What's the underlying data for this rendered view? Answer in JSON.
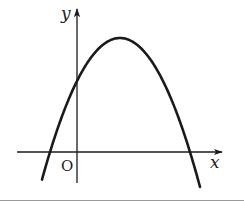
{
  "figure": {
    "type": "parabola-graph",
    "labels": {
      "x_axis": "x",
      "y_axis": "y",
      "origin": "O"
    },
    "colors": {
      "stroke": "#1a1a1a",
      "background": "#ffffff",
      "border": "#9a9a9a"
    },
    "geometry": {
      "origin_px": [
        77,
        152
      ],
      "x_axis_px": {
        "from": 17,
        "to": 222,
        "y": 152
      },
      "y_axis_px": {
        "x": 77,
        "from": 183,
        "to": 9
      },
      "vertex_px": [
        120,
        38
      ],
      "curvature_k": 0.02327,
      "curve_x_range_px": [
        42,
        200
      ],
      "roots_px": [
        50,
        190
      ],
      "y_intercept_px": 79
    }
  }
}
